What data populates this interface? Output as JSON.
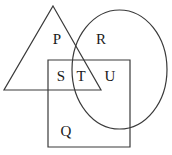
{
  "diagram": {
    "canvas": {
      "width": 172,
      "height": 155,
      "background": "#ffffff"
    },
    "stroke_color": "#3a3a3a",
    "label_color": "#1a1a1a",
    "stroke_width": 1.2,
    "shapes": [
      {
        "name": "triangle",
        "type": "polygon",
        "points": "53,6 101,90 4,90"
      },
      {
        "name": "ellipse",
        "type": "ellipse",
        "cx": 119.5,
        "cy": 69.5,
        "rx": 47.5,
        "ry": 59.5
      },
      {
        "name": "rectangle",
        "type": "rect",
        "x": 48,
        "y": 60,
        "width": 82,
        "height": 87
      }
    ],
    "labels": [
      {
        "id": "P",
        "text": "P",
        "x": 57,
        "y": 44
      },
      {
        "id": "R",
        "text": "R",
        "x": 101,
        "y": 44
      },
      {
        "id": "S",
        "text": "S",
        "x": 61,
        "y": 81
      },
      {
        "id": "T",
        "text": "T",
        "x": 81,
        "y": 81
      },
      {
        "id": "U",
        "text": "U",
        "x": 110,
        "y": 81
      },
      {
        "id": "Q",
        "text": "Q",
        "x": 66,
        "y": 136
      }
    ]
  }
}
